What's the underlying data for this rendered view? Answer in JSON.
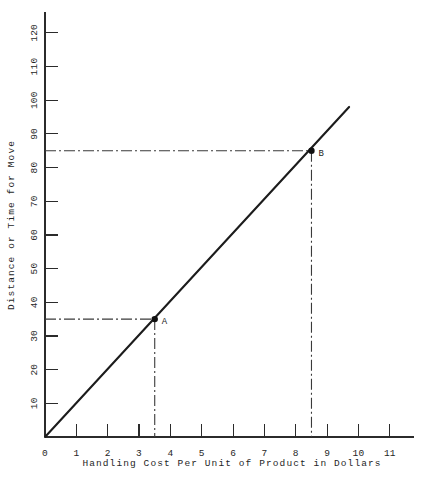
{
  "chart_data": {
    "type": "line",
    "title": "",
    "xlabel": "Handling Cost Per Unit of Product in Dollars",
    "ylabel": "Distance or Time for Move",
    "xlim": [
      0,
      11.75
    ],
    "ylim": [
      0,
      124
    ],
    "grid": false,
    "legend": null,
    "x_ticks": [
      0,
      1,
      2,
      3,
      4,
      5,
      6,
      7,
      8,
      9,
      10,
      11
    ],
    "x_tick_labels": [
      "0",
      "1",
      "2",
      "3",
      "4",
      "5",
      "6",
      "7",
      "8",
      "9",
      "10",
      "11"
    ],
    "y_ticks": [
      10,
      20,
      30,
      40,
      50,
      60,
      70,
      80,
      90,
      100,
      110,
      120
    ],
    "y_tick_labels": [
      "10",
      "20",
      "30",
      "40",
      "50",
      "60",
      "70",
      "80",
      "90",
      "100",
      "110",
      "120"
    ],
    "series": [
      {
        "name": "cost-vs-distance",
        "x": [
          0,
          9.7
        ],
        "values": [
          0,
          98
        ],
        "style": "solid"
      }
    ],
    "annotations": [
      {
        "label": "A",
        "x": 3.5,
        "y": 35,
        "guides": [
          "horizontal",
          "vertical"
        ],
        "guide_style": "dash-dot"
      },
      {
        "label": "B",
        "x": 8.5,
        "y": 85,
        "guides": [
          "horizontal",
          "vertical"
        ],
        "guide_style": "dash-dot"
      }
    ],
    "colors": {
      "line": "#1c1c1c",
      "axis": "#2b2b2b",
      "guide": "#3a3a3a",
      "background": "#ffffff",
      "text": "#1f1f1f"
    }
  }
}
